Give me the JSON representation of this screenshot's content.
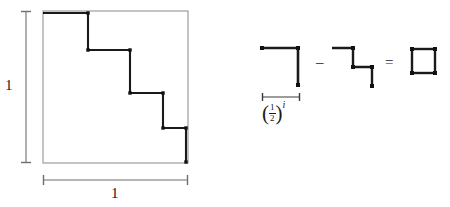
{
  "figure": {
    "background_color": "#ffffff",
    "ink_color": "#1a1a1a",
    "square_outline_color": "#777777",
    "width": 450,
    "height": 207
  },
  "left_panel": {
    "unit_square": {
      "x": 43,
      "y": 11,
      "width": 145,
      "height": 152,
      "stroke": "#8a8a8a"
    },
    "vertical_ruler": {
      "label": "1",
      "x": 26,
      "y_top": 11,
      "y_bottom": 163
    },
    "horizontal_ruler": {
      "label": "1",
      "x_left": 43,
      "x_right": 188,
      "y": 180
    },
    "staircase": {
      "stroke": "#1a1a1a",
      "stroke_width": 2.1,
      "corner_marker": "square-node",
      "description": "four descending steps from top-left to bottom-right corner",
      "points": [
        [
          43,
          13
        ],
        [
          88,
          13
        ],
        [
          88,
          50
        ],
        [
          130,
          50
        ],
        [
          130,
          93
        ],
        [
          163,
          93
        ],
        [
          163,
          128
        ],
        [
          186,
          128
        ],
        [
          186,
          162
        ]
      ],
      "nodes": [
        [
          88,
          13
        ],
        [
          88,
          50
        ],
        [
          130,
          50
        ],
        [
          130,
          93
        ],
        [
          163,
          93
        ],
        [
          163,
          128
        ],
        [
          186,
          128
        ],
        [
          186,
          162
        ]
      ]
    }
  },
  "right_panel": {
    "term_1": {
      "name": "elbow-shape",
      "stroke": "#1a1a1a",
      "stroke_width": 2.6,
      "points": [
        [
          262,
          48
        ],
        [
          298,
          48
        ],
        [
          298,
          85
        ]
      ],
      "nodes": [
        [
          262,
          48
        ],
        [
          298,
          48
        ],
        [
          298,
          85
        ]
      ]
    },
    "measure_bar": {
      "x_left": 262,
      "x_right": 300,
      "y": 97
    },
    "measure_label": {
      "open_paren": "(",
      "numerator": "1",
      "denominator": "2",
      "close_paren": ")",
      "exponent": "i",
      "plain_text": "(1/2)^i"
    },
    "minus_sign": "–",
    "term_2": {
      "name": "two-step-staircase",
      "stroke": "#1a1a1a",
      "stroke_width": 2.4,
      "points": [
        [
          332,
          48
        ],
        [
          353,
          48
        ],
        [
          353,
          67
        ],
        [
          372,
          67
        ],
        [
          372,
          86
        ]
      ],
      "nodes": [
        [
          353,
          48
        ],
        [
          353,
          67
        ],
        [
          372,
          67
        ],
        [
          372,
          86
        ]
      ]
    },
    "equals_sign": "=",
    "result": {
      "name": "small-square",
      "x": 412,
      "y": 49,
      "width": 23,
      "height": 24,
      "stroke": "#1a1a1a",
      "stroke_width": 2.4,
      "nodes": [
        [
          412,
          49
        ],
        [
          435,
          49
        ],
        [
          435,
          73
        ],
        [
          412,
          73
        ]
      ]
    }
  }
}
